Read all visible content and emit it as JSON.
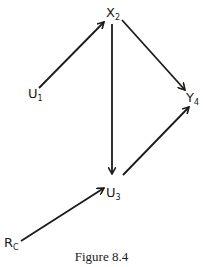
{
  "diagram": {
    "nodes": [
      {
        "id": "X2",
        "base": "X",
        "sub": "2"
      },
      {
        "id": "U1",
        "base": "U",
        "sub": "1"
      },
      {
        "id": "Y4",
        "base": "Y",
        "sub": "4"
      },
      {
        "id": "U3",
        "base": "U",
        "sub": "3"
      },
      {
        "id": "RC",
        "base": "R",
        "sub": "C"
      }
    ],
    "edges": [
      {
        "from": "U1",
        "to": "X2"
      },
      {
        "from": "X2",
        "to": "Y4"
      },
      {
        "from": "X2",
        "to": "U3"
      },
      {
        "from": "U3",
        "to": "Y4"
      },
      {
        "from": "RC",
        "to": "U3"
      }
    ],
    "caption": "Figure 8.4"
  }
}
